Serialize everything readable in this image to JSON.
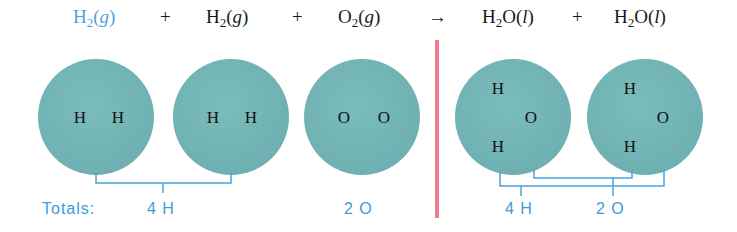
{
  "equation": {
    "terms": [
      {
        "species": "H",
        "sub": "2",
        "rest": "",
        "state": "g",
        "highlight": true
      },
      {
        "species": "H",
        "sub": "2",
        "rest": "",
        "state": "g",
        "highlight": false
      },
      {
        "species": "O",
        "sub": "2",
        "rest": "",
        "state": "g",
        "highlight": false
      },
      {
        "species": "H",
        "sub": "2",
        "rest": "O",
        "state": "l",
        "highlight": false
      },
      {
        "species": "H",
        "sub": "2",
        "rest": "O",
        "state": "l",
        "highlight": false
      }
    ],
    "plus": "+",
    "arrow": "→"
  },
  "molecules": [
    {
      "atoms": [
        "H",
        "H"
      ]
    },
    {
      "atoms": [
        "H",
        "H"
      ]
    },
    {
      "atoms": [
        "O",
        "O"
      ]
    },
    {
      "atoms": [
        "H",
        "O",
        "H"
      ]
    },
    {
      "atoms": [
        "H",
        "O",
        "H"
      ]
    }
  ],
  "totals": {
    "label": "Totals:",
    "reactant_h": "4 H",
    "reactant_o": "2 O",
    "product_h": "4 H",
    "product_o": "2 O"
  },
  "colors": {
    "accent_blue": "#4aa3df",
    "molecule_fill": "#6fb1b2",
    "divider_red": "#ef7a8c"
  }
}
